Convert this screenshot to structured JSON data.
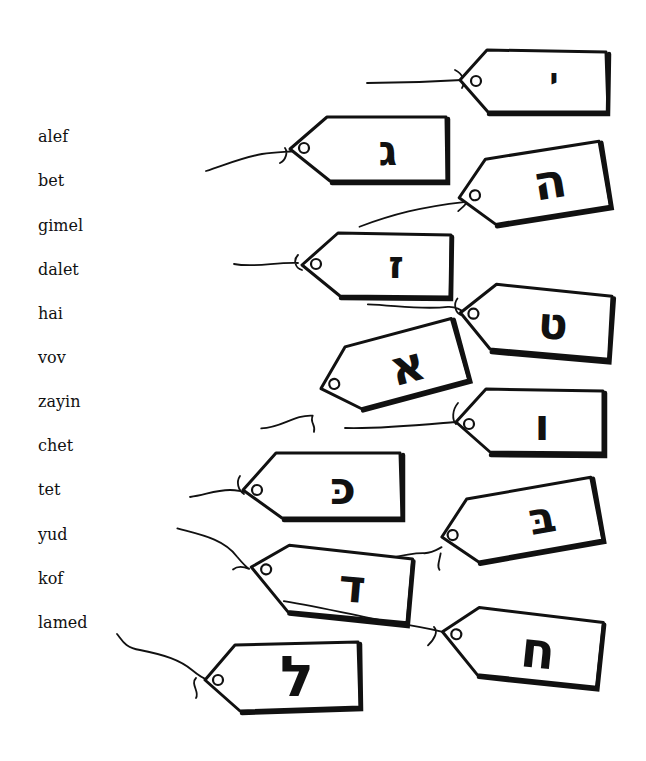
{
  "worksheet": {
    "letter_names": [
      "alef",
      "bet",
      "gimel",
      "dalet",
      "hai",
      "vov",
      "zayin",
      "chet",
      "tet",
      "yud",
      "kof",
      "lamed"
    ],
    "tags": [
      {
        "letter": "י",
        "name_hint": "yud"
      },
      {
        "letter": "ג",
        "name_hint": "gimel"
      },
      {
        "letter": "ה",
        "name_hint": "hai"
      },
      {
        "letter": "ז",
        "name_hint": "zayin"
      },
      {
        "letter": "ט",
        "name_hint": "tet"
      },
      {
        "letter": "א",
        "name_hint": "alef"
      },
      {
        "letter": "ו",
        "name_hint": "vov"
      },
      {
        "letter": "כּ",
        "name_hint": "kof"
      },
      {
        "letter": "בּ",
        "name_hint": "bet"
      },
      {
        "letter": "ד",
        "name_hint": "dalet"
      },
      {
        "letter": "ח",
        "name_hint": "chet"
      },
      {
        "letter": "ל",
        "name_hint": "lamed"
      }
    ],
    "colors": {
      "ink": "#111111",
      "paper": "#ffffff"
    }
  }
}
